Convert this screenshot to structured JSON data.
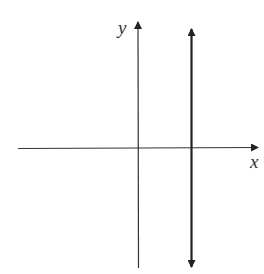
{
  "diagram": {
    "type": "coordinate-plane",
    "x_axis_label": "x",
    "y_axis_label": "y",
    "vertical_line": {
      "description": "vertical line to the right of the y-axis, arrows at both ends"
    },
    "colors": {
      "axes": "#333333",
      "line": "#222222",
      "background": "#ffffff"
    }
  }
}
